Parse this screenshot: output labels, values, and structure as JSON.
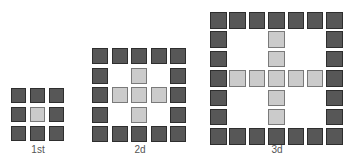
{
  "figures": [
    {
      "label": "1st",
      "size": 3,
      "left": 11,
      "top": 88,
      "cell": 15,
      "pitch": 19,
      "label_left": 8,
      "label_top": 144,
      "pattern": [
        "DDD",
        "DLD",
        "DDD"
      ]
    },
    {
      "label": "2d",
      "size": 5,
      "left": 92,
      "top": 48,
      "cell": 16,
      "pitch": 19.5,
      "label_left": 110,
      "label_top": 144,
      "pattern": [
        "DDDDD",
        "D.L.D",
        "DLLLD",
        "D.L.D",
        "DDDDD"
      ]
    },
    {
      "label": "3d",
      "size": 7,
      "left": 210,
      "top": 12,
      "cell": 16.5,
      "pitch": 19.4,
      "label_left": 247,
      "label_top": 144,
      "pattern": [
        "DDDDDDD",
        "D..L..D",
        "D..L..D",
        "DLLLLLD",
        "D..L..D",
        "D..L..D",
        "DDDDDDD"
      ]
    }
  ],
  "legend": {
    "D": "dark-square",
    "L": "light-square",
    ".": "empty"
  },
  "colors": {
    "dark_fill": "#575757",
    "dark_border": "#2e2e2e",
    "light_fill": "#cbcbcb",
    "light_border": "#7a7a7a",
    "label": "#555555"
  }
}
